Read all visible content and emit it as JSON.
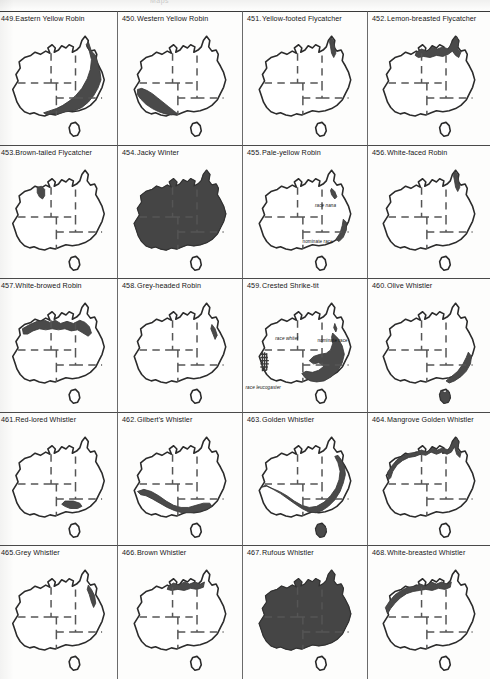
{
  "page": {
    "running_head_left": "Maps",
    "running_head_right": "",
    "type": "field-guide distribution map plate",
    "columns": 4,
    "rows": 5
  },
  "cells": [
    {
      "num": "449.",
      "name": "Eastern Yellow Robin",
      "range": "east-coast-broad",
      "labels": []
    },
    {
      "num": "450.",
      "name": "Western Yellow Robin",
      "range": "southwest-wedge",
      "labels": []
    },
    {
      "num": "451.",
      "name": "Yellow-footed Flycatcher",
      "range": "cape-york-tip",
      "labels": []
    },
    {
      "num": "452.",
      "name": "Lemon-breasted Flycatcher",
      "range": "top-end-cape",
      "labels": []
    },
    {
      "num": "453.",
      "name": "Brown-tailed Flycatcher",
      "range": "kimberley-small",
      "labels": []
    },
    {
      "num": "454.",
      "name": "Jacky Winter",
      "range": "whole-continent-minus-desert",
      "labels": []
    },
    {
      "num": "455.",
      "name": "Pale-yellow Robin",
      "range": "east-coast-two-patches",
      "labels": [
        {
          "text": "race nana",
          "x": 58,
          "y": 34
        },
        {
          "text": "nominate race",
          "x": 48,
          "y": 66
        }
      ]
    },
    {
      "num": "456.",
      "name": "White-faced Robin",
      "range": "cape-york-tip",
      "labels": []
    },
    {
      "num": "457.",
      "name": "White-browed Robin",
      "range": "northern-band",
      "labels": []
    },
    {
      "num": "458.",
      "name": "Grey-headed Robin",
      "range": "wet-tropics-sliver",
      "labels": []
    },
    {
      "num": "459.",
      "name": "Crested Shrike-tit",
      "range": "shriketit-three-races",
      "labels": [
        {
          "text": "race whitei",
          "x": 26,
          "y": 33
        },
        {
          "text": "nominate race",
          "x": 60,
          "y": 35
        },
        {
          "text": "race leucogaster",
          "x": 2,
          "y": 78
        }
      ]
    },
    {
      "num": "460.",
      "name": "Olive Whistler",
      "range": "se-coast-tas",
      "labels": []
    },
    {
      "num": "461.",
      "name": "Red-lored Whistler",
      "range": "mallee-small",
      "labels": []
    },
    {
      "num": "462.",
      "name": "Gilbert's Whistler",
      "range": "southern-arc",
      "labels": []
    },
    {
      "num": "463.",
      "name": "Golden Whistler",
      "range": "south-east-west-arc",
      "labels": []
    },
    {
      "num": "464.",
      "name": "Mangrove Golden Whistler",
      "range": "north-coastal-strip",
      "labels": []
    },
    {
      "num": "465.",
      "name": "Grey Whistler",
      "range": "ne-qld-strip",
      "labels": []
    },
    {
      "num": "466.",
      "name": "Brown Whistler",
      "range": "top-end-strip",
      "labels": []
    },
    {
      "num": "467.",
      "name": "Rufous Whistler",
      "range": "whole-continent-minus-desert",
      "labels": []
    },
    {
      "num": "468.",
      "name": "White-breasted Whistler",
      "range": "nw-coastal-strip",
      "labels": []
    }
  ]
}
